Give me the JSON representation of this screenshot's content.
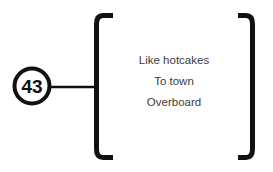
{
  "diagram": {
    "background_color": "#ffffff",
    "stroke_color": "#111111",
    "text_color": "#3c3c3c",
    "node": {
      "label": "43",
      "shape": "circle",
      "cx": 32,
      "cy": 86,
      "r": 18,
      "stroke_width": 4
    },
    "connector": {
      "x1": 50,
      "y1": 87,
      "x2": 97,
      "y2": 87,
      "stroke_width": 2.5
    },
    "bracket_group": {
      "left_bracket": "[",
      "right_bracket": "]",
      "top": 13,
      "bottom": 160,
      "left_x": 97,
      "right_x": 250,
      "stroke_width": 5
    },
    "items": [
      {
        "text": "Like hotcakes",
        "y": 64
      },
      {
        "text": "To town",
        "y": 85
      },
      {
        "text": "Overboard",
        "y": 106
      }
    ],
    "items_center_x": 174
  }
}
